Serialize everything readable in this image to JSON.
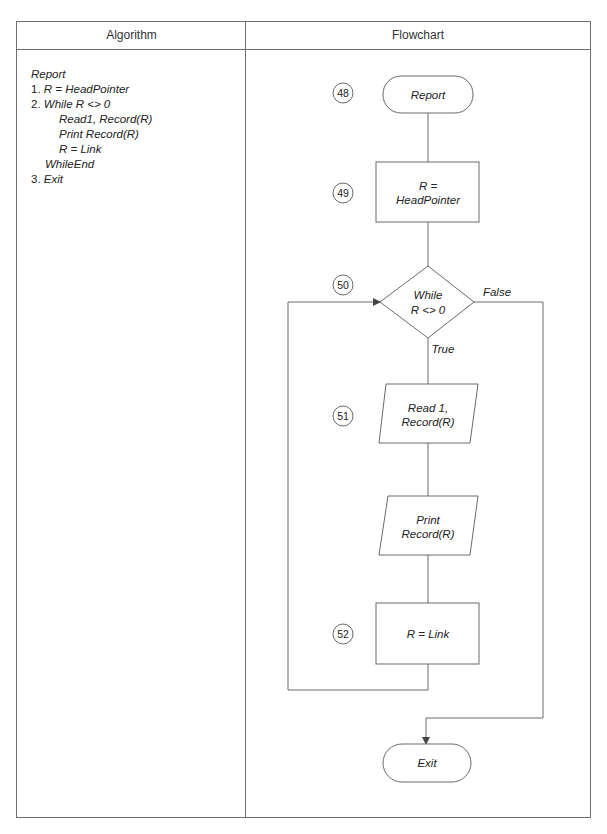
{
  "table": {
    "headers": {
      "algorithm": "Algorithm",
      "flowchart": "Flowchart"
    }
  },
  "algorithm": {
    "title": "Report",
    "lines": [
      {
        "num": "1. ",
        "text": "R = HeadPointer",
        "indent": 0
      },
      {
        "num": "2. ",
        "text": "While R <> 0",
        "indent": 0
      },
      {
        "num": "",
        "text": "Read1, Record(R)",
        "indent": 2
      },
      {
        "num": "",
        "text": "Print Record(R)",
        "indent": 2
      },
      {
        "num": "",
        "text": "R = Link",
        "indent": 2
      },
      {
        "num": "",
        "text": "WhileEnd",
        "indent": 1
      },
      {
        "num": "3. ",
        "text": "Exit",
        "indent": 0
      }
    ]
  },
  "flowchart": {
    "nodes": {
      "start": {
        "step": "48",
        "label": "Report",
        "shape": "terminal"
      },
      "init": {
        "step": "49",
        "label_line1": "R =",
        "label_line2": "HeadPointer",
        "shape": "process"
      },
      "loop": {
        "step": "50",
        "label_line1": "While",
        "label_line2": "R <> 0",
        "shape": "decision"
      },
      "read": {
        "step": "51",
        "label_line1": "Read 1,",
        "label_line2": "Record(R)",
        "shape": "io"
      },
      "print": {
        "label_line1": "Print",
        "label_line2": "Record(R)",
        "shape": "io"
      },
      "advance": {
        "step": "52",
        "label": "R = Link",
        "shape": "process"
      },
      "end": {
        "label": "Exit",
        "shape": "terminal"
      }
    },
    "edge_labels": {
      "true": "True",
      "false": "False"
    },
    "colors": {
      "line": "#6a6a6a",
      "text": "#222222"
    }
  }
}
